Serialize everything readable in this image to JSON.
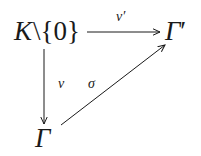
{
  "diagram": {
    "type": "commutative-triangle",
    "nodes": {
      "source": {
        "base": "K",
        "op": "\\",
        "set": "{0}"
      },
      "target_top": {
        "base": "Γ",
        "prime": "′"
      },
      "target_bottom": {
        "base": "Γ"
      }
    },
    "arrows": {
      "top": {
        "label": "v′",
        "from": "K\\{0}",
        "to": "Γ′"
      },
      "left": {
        "label": "v",
        "from": "K\\{0}",
        "to": "Γ"
      },
      "diagonal": {
        "label": "σ",
        "from": "Γ",
        "to": "Γ′"
      }
    },
    "colors": {
      "ink": "#1a1a1a",
      "background": "#ffffff"
    }
  }
}
